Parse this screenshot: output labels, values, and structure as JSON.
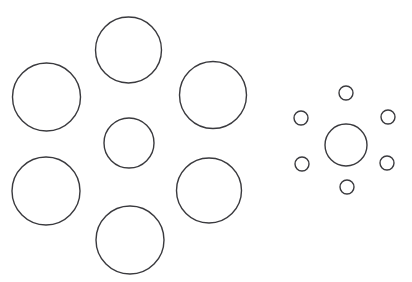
{
  "figure": {
    "canvas": {
      "width": 412,
      "height": 282,
      "background": "#ffffff"
    },
    "stroke_color": "#3a3a3e",
    "fill_color": "none",
    "stroke_width": 1.4
  },
  "chart_data": {
    "type": "scatter",
    "subtitle": "Two central target circles each surrounded by a ring of six inducer circles",
    "xlabel": "",
    "ylabel": "",
    "xlim": [
      0,
      412
    ],
    "ylim": [
      0,
      282
    ],
    "grid": false,
    "legend": null,
    "units": "pixels",
    "coordinate_origin": "top-left",
    "series": [
      {
        "name": "Left group — large inducers",
        "role": "inducer",
        "count": 6,
        "mean_radius": 33.6,
        "points": [
          {
            "id": "left-inducer-top",
            "cx": 128.5,
            "cy": 50.0,
            "r": 33.0
          },
          {
            "id": "left-inducer-upper-left",
            "cx": 46.5,
            "cy": 97.0,
            "r": 34.0
          },
          {
            "id": "left-inducer-upper-right",
            "cx": 213.0,
            "cy": 95.0,
            "r": 33.5
          },
          {
            "id": "left-inducer-lower-left",
            "cx": 46.0,
            "cy": 191.0,
            "r": 34.0
          },
          {
            "id": "left-inducer-lower-right",
            "cx": 209.0,
            "cy": 190.5,
            "r": 32.5
          },
          {
            "id": "left-inducer-bottom",
            "cx": 130.0,
            "cy": 240.0,
            "r": 34.0
          }
        ]
      },
      {
        "name": "Left group — target",
        "role": "target",
        "count": 1,
        "mean_radius": 25.0,
        "points": [
          {
            "id": "left-target-center",
            "cx": 129.0,
            "cy": 143.0,
            "r": 25.0
          }
        ]
      },
      {
        "name": "Right group — small inducers",
        "role": "inducer",
        "count": 6,
        "mean_radius": 7.0,
        "points": [
          {
            "id": "right-inducer-top",
            "cx": 346.0,
            "cy": 93.0,
            "r": 7.0
          },
          {
            "id": "right-inducer-upper-left",
            "cx": 301.0,
            "cy": 118.0,
            "r": 7.0
          },
          {
            "id": "right-inducer-upper-right",
            "cx": 388.0,
            "cy": 117.0,
            "r": 7.0
          },
          {
            "id": "right-inducer-lower-left",
            "cx": 302.0,
            "cy": 164.0,
            "r": 7.0
          },
          {
            "id": "right-inducer-lower-right",
            "cx": 387.0,
            "cy": 163.0,
            "r": 7.0
          },
          {
            "id": "right-inducer-bottom",
            "cx": 347.0,
            "cy": 187.0,
            "r": 7.0
          }
        ]
      },
      {
        "name": "Right group — target",
        "role": "target",
        "count": 1,
        "mean_radius": 21.0,
        "points": [
          {
            "id": "right-target-center",
            "cx": 346.0,
            "cy": 145.0,
            "r": 21.0
          }
        ]
      }
    ]
  }
}
